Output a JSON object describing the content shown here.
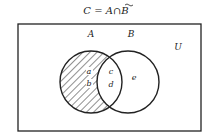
{
  "diagram": {
    "title_parts": {
      "lhs": "C",
      "eq": "=",
      "a": "A",
      "op": "∩",
      "b": "B"
    },
    "universe_label": "U",
    "sets": [
      {
        "name": "A",
        "label": "A",
        "shaded_region": "A minus B"
      },
      {
        "name": "B",
        "label": "B"
      }
    ],
    "regions": {
      "a": "a",
      "b": "b",
      "c": "c",
      "d": "d",
      "e": "e"
    },
    "colors": {
      "stroke": "#222222",
      "background": "#ffffff"
    }
  }
}
